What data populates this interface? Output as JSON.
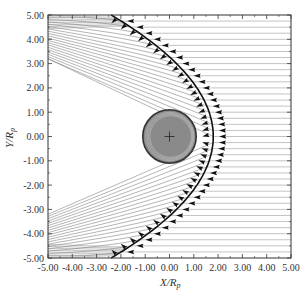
{
  "chart_data": {
    "type": "line",
    "title": "",
    "xlabel": "X/R_p",
    "ylabel": "Y/R_p",
    "xlabel_main": "X/R",
    "xlabel_sub": "p",
    "ylabel_main": "Y/R",
    "ylabel_sub": "p",
    "xlim": [
      -5.0,
      5.0
    ],
    "ylim": [
      -5.0,
      5.0
    ],
    "x_ticks": [
      "-5.00",
      "-4.00",
      "-3.00",
      "-2.00",
      "-1.00",
      "0.00",
      "1.00",
      "2.00",
      "3.00",
      "4.00",
      "5.00"
    ],
    "y_ticks": [
      "5.00",
      "4.00",
      "3.00",
      "2.00",
      "1.00",
      "0.00",
      "-1.00",
      "-2.00",
      "-3.00",
      "-4.00",
      "-5.00"
    ],
    "grid": false,
    "legend": null,
    "planet": {
      "center": [
        0.0,
        0.0
      ],
      "radius": 1.1,
      "fill": "#8a8a8a",
      "outline": "#333333",
      "marker": "+"
    },
    "bow_shock": {
      "shape": "parabola",
      "nose": [
        1.8,
        0.0
      ],
      "endpoints": [
        [
          -2.4,
          5.0
        ],
        [
          -2.4,
          -5.0
        ]
      ],
      "color": "#000000",
      "arrows_direction": "-x (incoming flow)"
    },
    "streamlines": {
      "upstream": "horizontal lines from x=5.00 to bow shock, spacing 0.25",
      "downstream": "deflected lines fanning toward upper-left and lower-left edges",
      "color": "#555555"
    }
  },
  "colors": {
    "axis": "#333333",
    "streamline": "#6a6a6a",
    "shock": "#111111",
    "arrow": "#111111",
    "planet_fill": "#8c8c8c"
  }
}
